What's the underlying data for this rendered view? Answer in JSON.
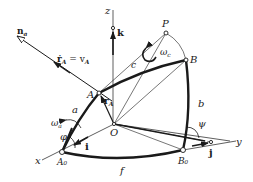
{
  "diagram": {
    "axes": {
      "x": {
        "label": "x",
        "unit_vector": "i"
      },
      "y": {
        "label": "y",
        "unit_vector": "j"
      },
      "z": {
        "label": "z",
        "unit_vector": "k"
      }
    },
    "points": {
      "origin": "O",
      "A": "A",
      "B": "B",
      "P": "P",
      "A0": "A₀",
      "B0": "B₀"
    },
    "arcs": {
      "a": "a",
      "b": "b",
      "c": "c",
      "f": "f"
    },
    "vectors": {
      "normal": "n",
      "normal_sub": "a",
      "velocity": "ṙ",
      "velocity_sub": "A",
      "velocity_eq": " = v",
      "velocity_eq_sub": "A",
      "position": "r",
      "position_sub": "A"
    },
    "angular_velocities": {
      "omega_a": "ω",
      "omega_a_sub": "a",
      "omega_c": "ω",
      "omega_c_sub": "c"
    },
    "angles": {
      "phi": "φ",
      "psi": "ψ"
    },
    "colors": {
      "ink": "#1a1a1a",
      "background": "#ffffff"
    }
  }
}
